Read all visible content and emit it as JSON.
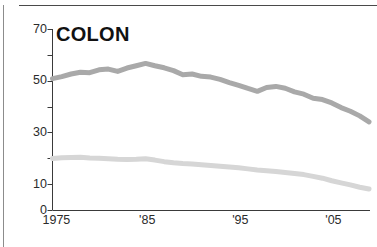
{
  "figure": {
    "name": "colon-cancer-rates-chart"
  },
  "chart_data": {
    "type": "line",
    "title": "COLON",
    "xlabel": "",
    "ylabel": "",
    "xlim": [
      1975,
      2009
    ],
    "ylim": [
      0,
      70
    ],
    "grid": false,
    "legend": "none",
    "y_ticks": [
      0,
      10,
      30,
      50,
      70
    ],
    "y_tick_labels": [
      "0",
      "10",
      "30",
      "50",
      "70"
    ],
    "y_minor_ticks": [
      20,
      40,
      60
    ],
    "x_ticks": [
      1975,
      1985,
      1995,
      2005
    ],
    "x_tick_labels": [
      "1975",
      "'85",
      "'95",
      "'05"
    ],
    "x": [
      1975,
      1976,
      1977,
      1978,
      1979,
      1980,
      1981,
      1982,
      1983,
      1984,
      1985,
      1986,
      1987,
      1988,
      1989,
      1990,
      1991,
      1992,
      1993,
      1994,
      1995,
      1996,
      1997,
      1998,
      1999,
      2000,
      2001,
      2002,
      2003,
      2004,
      2005,
      2006,
      2007,
      2008,
      2009
    ],
    "series": [
      {
        "name": "incidence",
        "color": "#a9a9a9",
        "values": [
          50.8,
          51.6,
          52.6,
          53.3,
          53.1,
          54.2,
          54.5,
          53.6,
          54.9,
          55.8,
          56.7,
          55.8,
          55.0,
          53.9,
          52.3,
          52.6,
          51.7,
          51.4,
          50.5,
          49.3,
          48.2,
          47.0,
          45.9,
          47.4,
          47.8,
          47.1,
          45.7,
          44.8,
          43.2,
          42.7,
          41.4,
          39.6,
          38.2,
          36.4,
          34.1
        ]
      },
      {
        "name": "mortality",
        "color": "#d6d6d6",
        "values": [
          19.9,
          20.2,
          20.3,
          20.4,
          20.1,
          20.0,
          19.8,
          19.6,
          19.5,
          19.6,
          19.8,
          19.3,
          18.7,
          18.3,
          18.0,
          17.8,
          17.5,
          17.2,
          16.9,
          16.6,
          16.3,
          15.9,
          15.5,
          15.2,
          14.9,
          14.5,
          14.1,
          13.7,
          13.0,
          12.3,
          11.3,
          10.5,
          9.7,
          8.8,
          8.1
        ]
      }
    ]
  }
}
